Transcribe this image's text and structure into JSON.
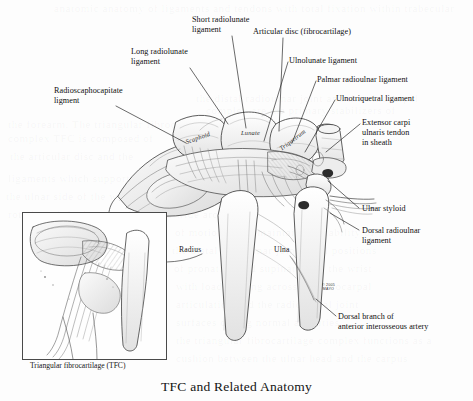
{
  "figure": {
    "title": "TFC and Related Anatomy",
    "inset_caption": "Triangular fibrocartilage (TFC)",
    "signature": "© 2005\nMAYO"
  },
  "callout_labels": [
    {
      "id": "short-radiolunate-ligament",
      "text": "Short radiolunate\nligament",
      "x": 192,
      "y": 15,
      "line": [
        [
          232,
          36
        ],
        [
          246,
          128
        ]
      ]
    },
    {
      "id": "articular-disc",
      "text": "Articular disc (fibrocartilage)",
      "x": 253,
      "y": 27,
      "line": [
        [
          283,
          38
        ],
        [
          279,
          131
        ]
      ]
    },
    {
      "id": "long-radiolunate-ligament",
      "text": "Long radiolunate\nligament",
      "x": 131,
      "y": 47,
      "line": [
        [
          190,
          68
        ],
        [
          228,
          124
        ]
      ]
    },
    {
      "id": "ulnolunate-ligament",
      "text": "Ulnolunate ligament",
      "x": 289,
      "y": 56,
      "line": [
        [
          288,
          62
        ],
        [
          264,
          141
        ]
      ]
    },
    {
      "id": "palmar-radioulnar-ligament",
      "text": "Palmar radioulnar ligament",
      "x": 317,
      "y": 75,
      "line": [
        [
          316,
          81
        ],
        [
          292,
          143
        ]
      ]
    },
    {
      "id": "radioscaphocapitate-ligment",
      "text": "Radioscaphocapitate\nligment",
      "x": 54,
      "y": 86,
      "line": [
        [
          116,
          106
        ],
        [
          186,
          143
        ]
      ]
    },
    {
      "id": "ulnotriquetral-ligament",
      "text": "Ulnotriquetral ligament",
      "x": 336,
      "y": 94,
      "line": [
        [
          335,
          100
        ],
        [
          305,
          152
        ]
      ]
    },
    {
      "id": "extensor-carpi-ulnaris-tendon",
      "text": "Extensor carpi\nulnaris tendon\nin sheath",
      "x": 362,
      "y": 118,
      "line": [
        [
          360,
          124
        ],
        [
          326,
          152
        ]
      ]
    },
    {
      "id": "ulnar-styloid",
      "text": "Ulnar styloid",
      "x": 362,
      "y": 204,
      "line": [
        [
          359,
          208
        ],
        [
          328,
          181
        ]
      ]
    },
    {
      "id": "dorsal-radioulnar-ligament",
      "text": "Dorsal radioulnar\nligament",
      "x": 362,
      "y": 226,
      "line": [
        [
          359,
          230
        ],
        [
          330,
          213
        ]
      ]
    },
    {
      "id": "dorsal-branch-anterior-interosseous-artery",
      "text": "Dorsal branch of\nanterior interosseous artery",
      "x": 338,
      "y": 312,
      "line": [
        [
          336,
          316
        ],
        [
          316,
          299
        ]
      ]
    }
  ],
  "structure_labels": [
    {
      "id": "scaphoid",
      "text": "Scaphoid",
      "x": 185,
      "y": 134,
      "style": "rot-n20"
    },
    {
      "id": "lunate",
      "text": "Lunate",
      "x": 241,
      "y": 129,
      "style": "flat"
    },
    {
      "id": "triquetrum",
      "text": "Triquetrum",
      "x": 277,
      "y": 136,
      "style": "rot-n38"
    },
    {
      "id": "radius",
      "text": "Radius",
      "x": 179,
      "y": 245,
      "style": "plain"
    },
    {
      "id": "ulna",
      "text": "Ulna",
      "x": 274,
      "y": 245,
      "style": "plain"
    }
  ],
  "ghost_text": [
    {
      "text": "anatomic anatomy of ligaments and tendons with total fixation within trabecular",
      "x": 54,
      "y": 2
    },
    {
      "text": "the distal radioulnar joint and the ulnocarpal",
      "x": 196,
      "y": 92
    },
    {
      "text": "complex are the primary stabilizers of",
      "x": 206,
      "y": 104
    },
    {
      "text": "the forearm. The triangular fibrocartilage",
      "x": 8,
      "y": 118
    },
    {
      "text": "complex TFC is composed of",
      "x": 8,
      "y": 132
    },
    {
      "text": "the articular disc and the",
      "x": 10,
      "y": 150
    },
    {
      "text": "ligaments which support",
      "x": 8,
      "y": 172
    },
    {
      "text": "the ulnar side of the wrist and allow for",
      "x": 6,
      "y": 190
    },
    {
      "text": "rotation of the forearm through a wide arc",
      "x": 8,
      "y": 208
    },
    {
      "text": "of motion while maintaining stability of",
      "x": 175,
      "y": 226
    },
    {
      "text": "the distal radioulnar joint in all positions",
      "x": 172,
      "y": 244
    },
    {
      "text": "of pronation and supination of the wrist",
      "x": 174,
      "y": 262
    },
    {
      "text": "with load bearing across the ulnocarpal",
      "x": 176,
      "y": 280
    },
    {
      "text": "articulation and the radiocarpal joint",
      "x": 176,
      "y": 298
    },
    {
      "text": "surfaces during normal activities",
      "x": 176,
      "y": 316
    },
    {
      "text": "the triangular fibrocartilage complex functions as a",
      "x": 176,
      "y": 334
    },
    {
      "text": "cushion between the ulnar head and the carpus",
      "x": 176,
      "y": 352
    }
  ],
  "colors": {
    "ink": "#1a1a1a",
    "paper": "#fdfdfd",
    "inset_border": "#4a4a4a",
    "drawing_line": "#2f2f2f",
    "drawing_shade": "#8d8d8d"
  }
}
